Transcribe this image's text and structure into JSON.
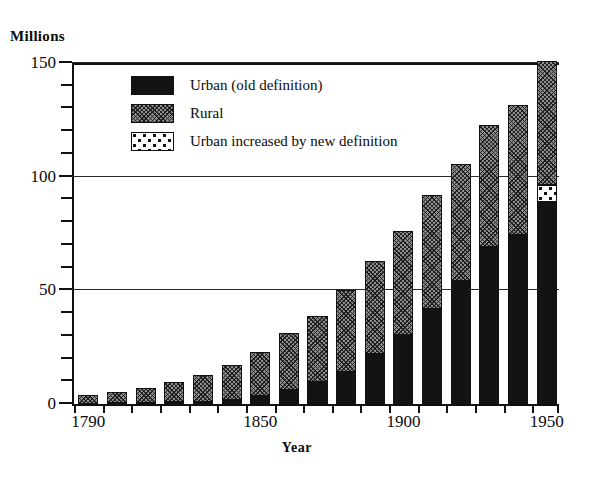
{
  "chart_data": {
    "type": "bar",
    "title": "",
    "subtitle": "",
    "xlabel": "Year",
    "ylabel": "Millions",
    "ylim": [
      0,
      150
    ],
    "ytick_step": 50,
    "yminor_step": 10,
    "grid": true,
    "stacked": true,
    "legend_position": "inside-top-left",
    "categories": [
      "1790",
      "1800",
      "1810",
      "1820",
      "1830",
      "1840",
      "1850",
      "1860",
      "1870",
      "1880",
      "1890",
      "1900",
      "1910",
      "1920",
      "1930",
      "1940",
      "1950"
    ],
    "xtick_labels": [
      "1790",
      "1850",
      "1900",
      "1950"
    ],
    "xtick_label_indices": [
      0,
      6,
      11,
      16
    ],
    "ytick_labels": [
      "0",
      "50",
      "100",
      "150"
    ],
    "ytick_values": [
      0,
      50,
      100,
      150
    ],
    "series": [
      {
        "name": "Urban (old definition)",
        "pattern": "solid-black",
        "color": "#131313",
        "values": [
          0.2,
          0.3,
          0.5,
          0.7,
          1.1,
          1.8,
          3.5,
          6.2,
          9.9,
          14.1,
          22.1,
          30.2,
          42.0,
          54.2,
          69.0,
          74.4,
          89.0
        ]
      },
      {
        "name": "Rural",
        "pattern": "gray-crosshatch",
        "color": "#8d8d8d",
        "values": [
          3.7,
          4.9,
          6.7,
          8.9,
          11.7,
          15.2,
          19.6,
          25.2,
          28.7,
          36.0,
          40.8,
          45.8,
          50.0,
          51.6,
          53.8,
          57.2,
          54.4
        ]
      },
      {
        "name": "Urban increased by new definition",
        "pattern": "white-dotted",
        "color": "#ffffff",
        "values": [
          0,
          0,
          0,
          0,
          0,
          0,
          0,
          0,
          0,
          0,
          0,
          0,
          0,
          0,
          0,
          0,
          7.5
        ]
      }
    ],
    "totals": [
      3.9,
      5.2,
      7.2,
      9.6,
      12.8,
      17.0,
      23.1,
      31.4,
      38.6,
      50.1,
      62.9,
      76.0,
      92.0,
      105.8,
      122.8,
      131.6,
      150.9
    ]
  },
  "axes": {
    "y_unit_caption": "Millions",
    "x_title": "Year"
  },
  "legend": {
    "items": [
      {
        "label": "Urban (old definition)",
        "swatch": "urban-swatch"
      },
      {
        "label": "Rural",
        "swatch": "rural-swatch"
      },
      {
        "label": "Urban increased by new definition",
        "swatch": "new-definition-swatch"
      }
    ]
  }
}
